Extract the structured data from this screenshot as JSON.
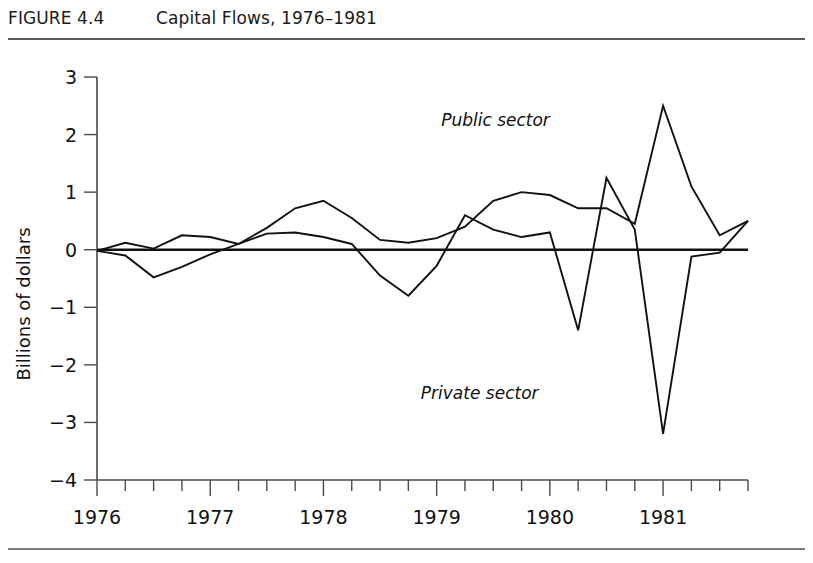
{
  "header": {
    "figure_number": "FIGURE 4.4",
    "title": "Capital Flows, 1976–1981"
  },
  "chart_data": {
    "type": "line",
    "title": "Capital Flows, 1976–1981",
    "xlabel": "",
    "ylabel": "Billions of dollars",
    "xlim": [
      1976.0,
      1981.75
    ],
    "ylim": [
      -4,
      3
    ],
    "yticks": [
      3,
      2,
      1,
      0,
      -1,
      -2,
      -3,
      -4
    ],
    "ytick_labels": [
      "3",
      "2",
      "1",
      "0",
      "−1",
      "−2",
      "−3",
      "−4"
    ],
    "xticks": [
      1976.0,
      1976.25,
      1976.5,
      1976.75,
      1977.0,
      1977.25,
      1977.5,
      1977.75,
      1978.0,
      1978.25,
      1978.5,
      1978.75,
      1979.0,
      1979.25,
      1979.5,
      1979.75,
      1980.0,
      1980.25,
      1980.5,
      1980.75,
      1981.0,
      1981.25,
      1981.5,
      1981.75
    ],
    "xtick_labels": [
      "1976",
      "",
      "",
      "",
      "1977",
      "",
      "",
      "",
      "1978",
      "",
      "",
      "",
      "1979",
      "",
      "",
      "",
      "1980",
      "",
      "",
      "",
      "1981",
      "",
      "",
      ""
    ],
    "major_xticks": [
      1976,
      1977,
      1978,
      1979,
      1980,
      1981
    ],
    "grid": false,
    "legend_position": "inline-annotation",
    "zero_reference_line": true,
    "x": [
      1976.0,
      1976.25,
      1976.5,
      1976.75,
      1977.0,
      1977.25,
      1977.5,
      1977.75,
      1978.0,
      1978.25,
      1978.5,
      1978.75,
      1979.0,
      1979.25,
      1979.5,
      1979.75,
      1980.0,
      1980.25,
      1980.5,
      1980.75,
      1981.0,
      1981.25,
      1981.5,
      1981.75
    ],
    "series": [
      {
        "name": "Public sector",
        "label": "Public sector",
        "values": [
          -0.02,
          0.12,
          0.02,
          0.25,
          0.22,
          0.1,
          0.38,
          0.72,
          0.85,
          0.55,
          0.17,
          0.12,
          0.2,
          0.4,
          0.85,
          1.0,
          0.95,
          0.72,
          0.72,
          0.45,
          2.5,
          1.1,
          0.25,
          0.5
        ]
      },
      {
        "name": "Private sector",
        "label": "Private sector",
        "values": [
          -0.02,
          -0.1,
          -0.48,
          -0.3,
          -0.08,
          0.1,
          0.28,
          0.3,
          0.22,
          0.1,
          -0.45,
          -0.8,
          -0.28,
          0.6,
          0.35,
          0.22,
          0.3,
          -1.4,
          1.25,
          0.35,
          -3.2,
          -0.12,
          -0.05,
          0.5
        ]
      }
    ],
    "annotations": [
      {
        "text": "Public sector",
        "x": 1980.0,
        "y": 2.15
      },
      {
        "text": "Private sector",
        "x": 1979.9,
        "y": -2.6
      }
    ]
  },
  "colors": {
    "line": "#111111",
    "axis": "#4a4a4a",
    "rule": "#5b5b5b",
    "background": "#ffffff"
  }
}
